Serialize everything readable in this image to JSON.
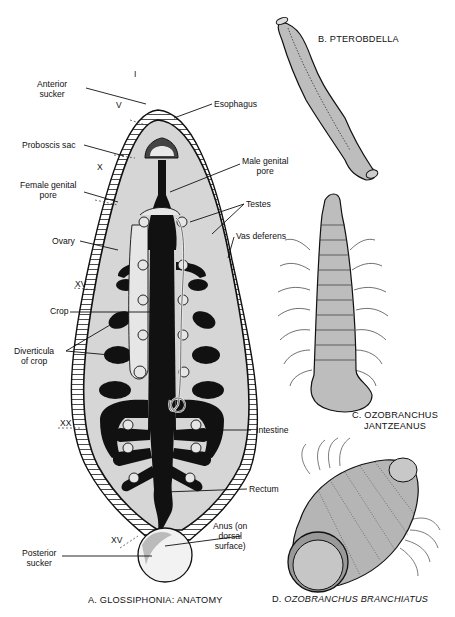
{
  "figure": {
    "panels": [
      {
        "id": "A",
        "caption": "A. GLOSSIPHONIA: ANATOMY"
      },
      {
        "id": "B",
        "caption": "B. PTEROBDELLA"
      },
      {
        "id": "C",
        "caption_line1": "C. OZOBRANCHUS",
        "caption_line2": "JANTZEANUS"
      },
      {
        "id": "D",
        "caption_prefix": "D.",
        "caption_italic": "OZOBRANCHUS BRANCHIATUS"
      }
    ],
    "labels_left": {
      "anterior_sucker": [
        "Anterior",
        "sucker"
      ],
      "proboscis_sac": "Proboscis sac",
      "female_genital_pore": [
        "Female genital",
        "pore"
      ],
      "ovary": "Ovary",
      "crop": "Crop",
      "diverticula": [
        "Diverticula",
        "of crop"
      ],
      "posterior_sucker": [
        "Posterior",
        "sucker"
      ]
    },
    "labels_right": {
      "esophagus": "Esophagus",
      "male_genital_pore": [
        "Male genital",
        "pore"
      ],
      "testes": "Testes",
      "vas_deferens": "Vas deferens",
      "intestine": "Intestine",
      "rectum": "Rectum",
      "anus": [
        "Anus (on",
        "dorsal",
        "surface)"
      ]
    },
    "segment_markers": [
      "I",
      "V",
      "X",
      "XV",
      "XX",
      "XV"
    ]
  }
}
